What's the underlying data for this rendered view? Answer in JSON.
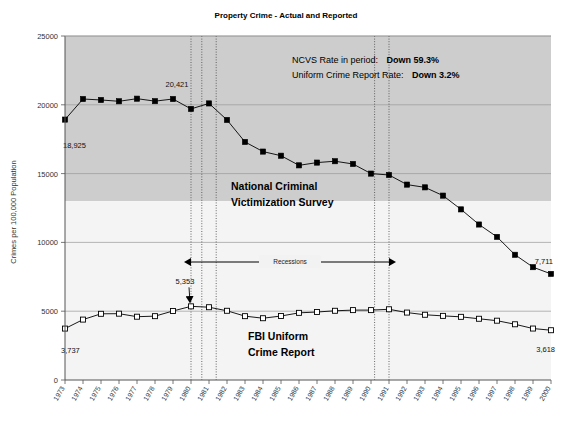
{
  "chart_data": {
    "type": "line",
    "title": "Property Crime - Actual and Reported",
    "xlabel": "",
    "ylabel": "Crimes per 100,000 Population",
    "ylim": [
      0,
      25000
    ],
    "ytick_labels": [
      "0",
      "5000",
      "10000",
      "15000",
      "20000",
      "25000"
    ],
    "ytick_values": [
      0,
      5000,
      10000,
      15000,
      20000,
      25000
    ],
    "grid": true,
    "legend_position": "inline-labels",
    "x": [
      1973,
      1974,
      1975,
      1976,
      1977,
      1978,
      1979,
      1980,
      1981,
      1982,
      1983,
      1984,
      1985,
      1986,
      1987,
      1988,
      1989,
      1990,
      1991,
      1992,
      1993,
      1994,
      1995,
      1996,
      1997,
      1998,
      1999,
      2000
    ],
    "categories": [
      "1973",
      "1974",
      "1975",
      "1976",
      "1977",
      "1978",
      "1979",
      "1980",
      "1981",
      "1982",
      "1983",
      "1984",
      "1985",
      "1986",
      "1987",
      "1988",
      "1989",
      "1990",
      "1991",
      "1992",
      "1993",
      "1994",
      "1995",
      "1996",
      "1997",
      "1998",
      "1999",
      "2000"
    ],
    "series": [
      {
        "name": "National Criminal Victimization Survey",
        "marker": "filled-square",
        "color": "#000000",
        "values": [
          18925,
          20421,
          20350,
          20255,
          20445,
          20265,
          20421,
          19700,
          20100,
          18900,
          17300,
          16600,
          16300,
          15600,
          15800,
          15900,
          15700,
          15000,
          14900,
          14200,
          14000,
          13400,
          12400,
          11300,
          10400,
          9100,
          8200,
          7711
        ]
      },
      {
        "name": "FBI Uniform Crime Report",
        "marker": "open-square",
        "color": "#000000",
        "values": [
          3737,
          4390,
          4810,
          4820,
          4600,
          4640,
          5017,
          5353,
          5290,
          5030,
          4640,
          4490,
          4650,
          4880,
          4940,
          5030,
          5080,
          5080,
          5140,
          4900,
          4740,
          4660,
          4590,
          4450,
          4310,
          4050,
          3740,
          3618
        ]
      }
    ],
    "point_labels": [
      {
        "series": "National Criminal Victimization Survey",
        "x": 1973,
        "text": "18,925"
      },
      {
        "series": "National Criminal Victimization Survey",
        "x": 1979,
        "text": "20,421"
      },
      {
        "series": "National Criminal Victimization Survey",
        "x": 2000,
        "text": "7,711"
      },
      {
        "series": "FBI Uniform Crime Report",
        "x": 1973,
        "text": "3,737"
      },
      {
        "series": "FBI Uniform Crime Report",
        "x": 1980,
        "text": "5,353"
      },
      {
        "series": "FBI Uniform Crime Report",
        "x": 2000,
        "text": "3,618"
      }
    ],
    "annotations": {
      "summary": [
        {
          "label": "NCVS Rate in period:",
          "value": "Down 59.3%"
        },
        {
          "label": "Uniform Crime Report Rate:",
          "value": "Down 3.2%"
        }
      ],
      "recessions_label": "Recessions",
      "recession_markers": [
        1980.0,
        1980.6,
        1981.4,
        1990.2,
        1991.0
      ]
    }
  }
}
